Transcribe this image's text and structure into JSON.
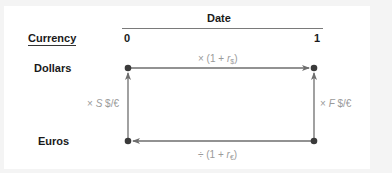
{
  "header": {
    "group_label": "Date",
    "row_header": "Currency",
    "columns": [
      "0",
      "1"
    ]
  },
  "rows": [
    "Dollars",
    "Euros"
  ],
  "edges": {
    "top": {
      "prefix": "× (1 + ",
      "var": "r",
      "sub": "$",
      "suffix": ")"
    },
    "bottom": {
      "prefix": "÷ (1 + ",
      "var": "r",
      "sub": "€",
      "suffix": ")"
    },
    "left": {
      "prefix": "× ",
      "var": "S",
      "suffix": " $/€"
    },
    "right": {
      "prefix": "× ",
      "var": "F",
      "suffix": " $/€"
    }
  },
  "colors": {
    "line": "#6e6e6e",
    "dot": "#3a3a3a",
    "math_text": "#9a9a9a",
    "label_text": "#1a1a1a"
  }
}
